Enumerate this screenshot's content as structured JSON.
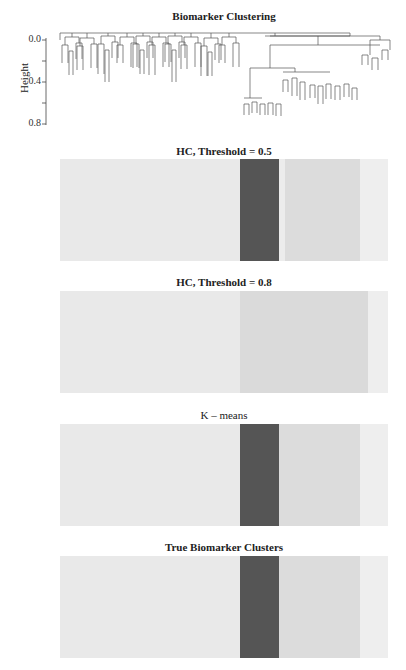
{
  "chart_data": [
    {
      "type": "dendrogram",
      "title": "Biomarker Clustering",
      "ylabel": "Height",
      "yticks": [
        0.0,
        0.2,
        0.4,
        0.6,
        0.8
      ],
      "ytick_labels": [
        "0.0",
        "0.4",
        "0.8"
      ],
      "ylim": [
        0.0,
        0.8
      ],
      "inverted_y": true,
      "grid": false,
      "description": "Hierarchical clustering dendrogram with a large left group of ~60 leaves merging near height 0.0, and a right branch splitting near 0.1 into a small right cluster (~8 leaves) and a deep subtree reaching ~0.75"
    },
    {
      "type": "heatmap",
      "title": "HC, Threshold = 0.5",
      "segments": [
        {
          "start": 0.0,
          "end": 0.549,
          "color": "#e9e9e9"
        },
        {
          "start": 0.549,
          "end": 0.668,
          "color": "#555555"
        },
        {
          "start": 0.668,
          "end": 0.686,
          "color": "#ececec"
        },
        {
          "start": 0.686,
          "end": 0.915,
          "color": "#dcdcdc"
        },
        {
          "start": 0.915,
          "end": 1.0,
          "color": "#eeeeee"
        }
      ]
    },
    {
      "type": "heatmap",
      "title": "HC, Threshold = 0.8",
      "segments": [
        {
          "start": 0.0,
          "end": 0.549,
          "color": "#e9e9e9"
        },
        {
          "start": 0.549,
          "end": 0.939,
          "color": "#dadada"
        },
        {
          "start": 0.939,
          "end": 1.0,
          "color": "#eeeeee"
        }
      ]
    },
    {
      "type": "heatmap",
      "title": "K – means",
      "segments": [
        {
          "start": 0.0,
          "end": 0.549,
          "color": "#e9e9e9"
        },
        {
          "start": 0.549,
          "end": 0.668,
          "color": "#555555"
        },
        {
          "start": 0.668,
          "end": 0.915,
          "color": "#dcdcdc"
        },
        {
          "start": 0.915,
          "end": 1.0,
          "color": "#eeeeee"
        }
      ]
    },
    {
      "type": "heatmap",
      "title": "True Biomarker Clusters",
      "segments": [
        {
          "start": 0.0,
          "end": 0.549,
          "color": "#e9e9e9"
        },
        {
          "start": 0.549,
          "end": 0.668,
          "color": "#555555"
        },
        {
          "start": 0.668,
          "end": 0.915,
          "color": "#dcdcdc"
        },
        {
          "start": 0.915,
          "end": 1.0,
          "color": "#eeeeee"
        }
      ]
    }
  ],
  "dendrogram": {
    "title": "Biomarker Clustering",
    "ylabel": "Height",
    "ticks": [
      {
        "y": 40,
        "label": "0.0"
      },
      {
        "y": 61,
        "label": ""
      },
      {
        "y": 82,
        "label": "0.4"
      },
      {
        "y": 103,
        "label": ""
      },
      {
        "y": 124,
        "label": "0.8"
      }
    ]
  },
  "panels": [
    {
      "title": "HC, Threshold = 0.5",
      "bold": true
    },
    {
      "title": "HC, Threshold = 0.8",
      "bold": true
    },
    {
      "title": "K – means",
      "bold": false
    },
    {
      "title": "True Biomarker Clusters",
      "bold": true
    }
  ]
}
